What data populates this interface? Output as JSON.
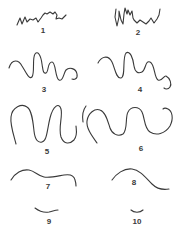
{
  "figure": {
    "panels": [
      {
        "label": "1",
        "x": 43,
        "y": 31
      },
      {
        "label": "2",
        "x": 138,
        "y": 33
      },
      {
        "label": "3",
        "x": 44,
        "y": 90
      },
      {
        "label": "4",
        "x": 140,
        "y": 90
      },
      {
        "label": "5",
        "x": 47,
        "y": 152
      },
      {
        "label": "6",
        "x": 141,
        "y": 149
      },
      {
        "label": "7",
        "x": 48,
        "y": 187
      },
      {
        "label": "8",
        "x": 134,
        "y": 183
      },
      {
        "label": "9",
        "x": 49,
        "y": 222
      },
      {
        "label": "10",
        "x": 137,
        "y": 222
      }
    ],
    "stroke_color": "#3a3a3a",
    "background": "#ffffff"
  }
}
